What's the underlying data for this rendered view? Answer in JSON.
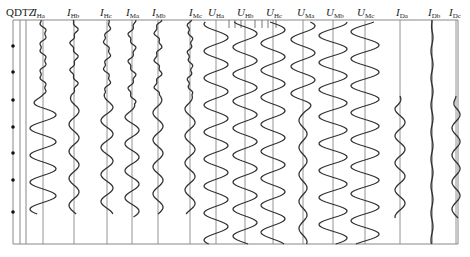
{
  "figure": {
    "title_label": "QDTZ",
    "frame": {
      "left": 13,
      "right": 458,
      "top": 20,
      "bottom": 244
    },
    "colors": {
      "trace": "#333333",
      "baseline": "#888888",
      "frame": "#888888",
      "dot": "#111111"
    },
    "qdtz_dots_y": [
      46,
      72,
      100,
      127,
      153,
      180,
      212
    ],
    "qdtz_lines_x": [
      13,
      20,
      26
    ],
    "channels": [
      {
        "id": "IHa",
        "sym": "I",
        "sub": "Ha",
        "x": 43,
        "label_x": 33,
        "kind": "current",
        "pre_amp": 3,
        "post_amp": 13,
        "start": 20,
        "end": 214,
        "onset": 95
      },
      {
        "id": "IHb",
        "sym": "I",
        "sub": "Hb",
        "x": 74,
        "label_x": 67,
        "kind": "current",
        "pre_amp": 3,
        "post_amp": 5,
        "start": 20,
        "end": 214,
        "onset": 95
      },
      {
        "id": "IHc",
        "sym": "I",
        "sub": "Hc",
        "x": 107,
        "label_x": 100,
        "kind": "current",
        "pre_amp": 3,
        "post_amp": 6,
        "start": 20,
        "end": 214,
        "onset": 95
      },
      {
        "id": "IMa",
        "sym": "I",
        "sub": "Ma",
        "x": 132,
        "label_x": 126,
        "kind": "current",
        "pre_amp": 3,
        "post_amp": 7,
        "start": 20,
        "end": 217,
        "onset": 105
      },
      {
        "id": "IMb",
        "sym": "I",
        "sub": "Mb",
        "x": 158,
        "label_x": 152,
        "kind": "current",
        "pre_amp": 3,
        "post_amp": 5,
        "start": 20,
        "end": 214,
        "onset": 95
      },
      {
        "id": "IMc",
        "sym": "I",
        "sub": "Mc",
        "x": 190,
        "label_x": 189,
        "kind": "current",
        "pre_amp": 2,
        "post_amp": 5,
        "start": 20,
        "end": 214,
        "onset": 95
      },
      {
        "id": "UHa",
        "sym": "U",
        "sub": "Ha",
        "x": 216,
        "label_x": 208,
        "kind": "voltage",
        "pre_amp": 12,
        "post_amp": 12,
        "start": 22,
        "end": 244,
        "onset": 0
      },
      {
        "id": "UHb",
        "sym": "U",
        "sub": "Hb",
        "x": 245,
        "label_x": 237,
        "kind": "voltage",
        "pre_amp": 12,
        "post_amp": 12,
        "start": 22,
        "end": 244,
        "onset": 0
      },
      {
        "id": "UHc",
        "sym": "U",
        "sub": "Hc",
        "x": 273,
        "label_x": 266,
        "kind": "voltage",
        "pre_amp": 12,
        "post_amp": 12,
        "start": 22,
        "end": 244,
        "onset": 0
      },
      {
        "id": "UMa",
        "sym": "U",
        "sub": "Ma",
        "x": 303,
        "label_x": 297,
        "kind": "voltage",
        "pre_amp": 12,
        "post_amp": 4,
        "start": 22,
        "end": 244,
        "onset": 100
      },
      {
        "id": "UMb",
        "sym": "U",
        "sub": "Mb",
        "x": 333,
        "label_x": 326,
        "kind": "voltage",
        "pre_amp": 14,
        "post_amp": 14,
        "start": 22,
        "end": 244,
        "onset": 0
      },
      {
        "id": "UMc",
        "sym": "U",
        "sub": "Mc",
        "x": 365,
        "label_x": 357,
        "kind": "voltage",
        "pre_amp": 14,
        "post_amp": 14,
        "start": 22,
        "end": 244,
        "onset": 0
      },
      {
        "id": "IDa",
        "sym": "I",
        "sub": "Da",
        "x": 400,
        "label_x": 396,
        "kind": "current",
        "pre_amp": 0,
        "post_amp": 5,
        "start": 96,
        "end": 218,
        "onset": 96
      },
      {
        "id": "IDb",
        "sym": "I",
        "sub": "Db",
        "x": 432,
        "label_x": 428,
        "kind": "current",
        "pre_amp": 0,
        "post_amp": 1,
        "start": 20,
        "end": 244,
        "onset": 20
      },
      {
        "id": "IDc",
        "sym": "I",
        "sub": "Dc",
        "x": 456,
        "label_x": 449,
        "kind": "current",
        "pre_amp": 0,
        "post_amp": 4,
        "start": 96,
        "end": 218,
        "onset": 96
      }
    ],
    "period_px": 27,
    "tick_marks": {
      "y1": 20,
      "y2": 28,
      "x": [
        229,
        235,
        241,
        255,
        262,
        268,
        276
      ]
    }
  }
}
